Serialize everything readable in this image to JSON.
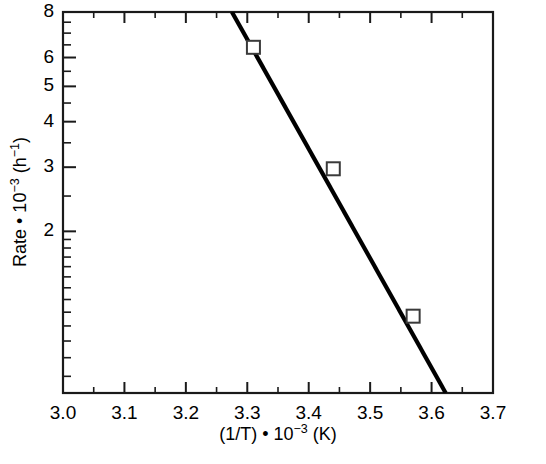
{
  "chart_data": {
    "type": "scatter",
    "title": "",
    "subtitle": "",
    "xlabel": "(1/T) • 10−3 (K)",
    "ylabel": "Rate • 10−3 (h−1)",
    "xlabel_parts": {
      "base": "(1/T) • 10",
      "exp": "−3",
      "unit": " (K)"
    },
    "ylabel_parts": {
      "base": "Rate • 10",
      "exp": "−3",
      "unit": " (h",
      "exp2": "−1",
      "unit_close": ")"
    },
    "xscale": "linear",
    "yscale": "log",
    "xlim": [
      3.0,
      3.7
    ],
    "ylim": [
      0.72,
      8.0
    ],
    "grid": false,
    "legend": null,
    "legend_position": "none",
    "x_major_ticks": [
      3.0,
      3.1,
      3.2,
      3.3,
      3.4,
      3.5,
      3.6,
      3.7
    ],
    "x_tick_labels": [
      "3.0",
      "3.1",
      "3.2",
      "3.3",
      "3.4",
      "3.5",
      "3.6",
      "3.7"
    ],
    "x_minor_ticks": [
      3.05,
      3.15,
      3.25,
      3.35,
      3.45,
      3.55,
      3.65
    ],
    "y_labeled_ticks": [
      2,
      3,
      4,
      5,
      6,
      8
    ],
    "y_tick_labels": [
      "2",
      "3",
      "4",
      "5",
      "6",
      "8"
    ],
    "y_minor_ticks": [
      0.8,
      0.9,
      1,
      1.1,
      1.2,
      1.3,
      1.4,
      1.5,
      1.6,
      1.7,
      1.8,
      1.9,
      2.5,
      3.5,
      4.5,
      5.5,
      6.5,
      7,
      7.5
    ],
    "series": [
      {
        "name": "rate-vs-inverse-temperature",
        "marker": "open-square",
        "line_color": "#000000",
        "marker_fill": "#ffffff",
        "marker_edge": "#3a3a3a",
        "x": [
          3.31,
          3.44,
          3.57
        ],
        "y": [
          6.4,
          2.97,
          1.17
        ]
      }
    ],
    "fit_line": {
      "x_start": 3.275,
      "y_start": 8.0,
      "x_end": 3.623,
      "y_end": 0.72
    }
  },
  "plot": {
    "frame_label": "plot-frame",
    "caption": ""
  }
}
